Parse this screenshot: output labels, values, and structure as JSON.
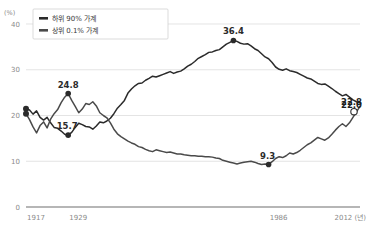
{
  "chart_data": {
    "type": "line",
    "title": "",
    "subtitle": "",
    "xlabel": "년",
    "ylabel": "(%)",
    "unit_label": "(%)",
    "xlim": [
      1917,
      2012
    ],
    "ylim": [
      0,
      40
    ],
    "grid": true,
    "y_ticks": [
      0,
      10,
      20,
      30,
      40
    ],
    "y_tick_labels": [
      "0",
      "10",
      "20",
      "30",
      "40"
    ],
    "x_ticks": [
      1917,
      1929,
      1986,
      2012
    ],
    "x_tick_labels": [
      "1917",
      "1929",
      "1986",
      "2012 (년)"
    ],
    "legend_position": "top-left",
    "series": [
      {
        "name": "하위 90% 가계",
        "color": "#2b2b2b",
        "x": [
          1917,
          1918,
          1919,
          1920,
          1921,
          1922,
          1923,
          1924,
          1925,
          1926,
          1927,
          1928,
          1929,
          1930,
          1931,
          1932,
          1933,
          1934,
          1935,
          1936,
          1937,
          1938,
          1939,
          1940,
          1941,
          1942,
          1943,
          1944,
          1945,
          1946,
          1947,
          1948,
          1949,
          1950,
          1951,
          1952,
          1953,
          1954,
          1955,
          1956,
          1957,
          1958,
          1959,
          1960,
          1961,
          1962,
          1963,
          1964,
          1965,
          1966,
          1967,
          1968,
          1969,
          1970,
          1971,
          1972,
          1973,
          1974,
          1975,
          1976,
          1977,
          1978,
          1979,
          1980,
          1981,
          1982,
          1983,
          1984,
          1985,
          1986,
          1987,
          1988,
          1989,
          1990,
          1991,
          1992,
          1993,
          1994,
          1995,
          1996,
          1997,
          1998,
          1999,
          2000,
          2001,
          2002,
          2003,
          2004,
          2005,
          2006,
          2007,
          2008,
          2009,
          2010,
          2011,
          2012
        ],
        "values": [
          21.5,
          21.2,
          20.3,
          21.0,
          19.6,
          19.0,
          19.6,
          18.4,
          17.4,
          17.2,
          16.6,
          15.9,
          15.7,
          16.3,
          17.4,
          18.3,
          18.0,
          17.6,
          17.5,
          17.0,
          17.7,
          18.6,
          18.4,
          18.8,
          19.4,
          20.4,
          21.6,
          22.4,
          23.3,
          24.9,
          25.8,
          26.5,
          27.0,
          27.1,
          27.7,
          28.1,
          28.6,
          28.4,
          28.7,
          29.0,
          29.3,
          29.6,
          29.2,
          29.5,
          29.7,
          30.2,
          30.8,
          31.2,
          31.8,
          32.5,
          32.9,
          33.3,
          33.8,
          33.9,
          34.2,
          34.4,
          35.0,
          35.6,
          36.0,
          36.4,
          36.2,
          35.8,
          35.6,
          35.7,
          35.2,
          34.6,
          34.2,
          33.5,
          32.8,
          32.4,
          31.6,
          30.6,
          30.1,
          29.9,
          30.2,
          29.8,
          29.6,
          29.4,
          29.0,
          28.6,
          28.2,
          28.0,
          27.5,
          27.0,
          26.8,
          26.9,
          26.4,
          25.9,
          25.3,
          24.8,
          24.3,
          24.6,
          24.0,
          23.4,
          23.0,
          22.8
        ]
      },
      {
        "name": "상위 0.1% 가계",
        "color": "#4a4a4a",
        "x": [
          1917,
          1918,
          1919,
          1920,
          1921,
          1922,
          1923,
          1924,
          1925,
          1926,
          1927,
          1928,
          1929,
          1930,
          1931,
          1932,
          1933,
          1934,
          1935,
          1936,
          1937,
          1938,
          1939,
          1940,
          1941,
          1942,
          1943,
          1944,
          1945,
          1946,
          1947,
          1948,
          1949,
          1950,
          1951,
          1952,
          1953,
          1954,
          1955,
          1956,
          1957,
          1958,
          1959,
          1960,
          1961,
          1962,
          1963,
          1964,
          1965,
          1966,
          1967,
          1968,
          1969,
          1970,
          1971,
          1972,
          1973,
          1974,
          1975,
          1976,
          1977,
          1978,
          1979,
          1980,
          1981,
          1982,
          1983,
          1984,
          1985,
          1986,
          1987,
          1988,
          1989,
          1990,
          1991,
          1992,
          1993,
          1994,
          1995,
          1996,
          1997,
          1998,
          1999,
          2000,
          2001,
          2002,
          2003,
          2004,
          2005,
          2006,
          2007,
          2008,
          2009,
          2010,
          2011,
          2012
        ],
        "values": [
          20.4,
          19.1,
          17.5,
          16.2,
          17.8,
          18.6,
          17.3,
          19.2,
          20.4,
          21.3,
          22.8,
          24.0,
          24.8,
          23.3,
          22.0,
          20.6,
          21.4,
          22.6,
          22.4,
          23.0,
          22.1,
          20.6,
          20.0,
          19.5,
          18.4,
          17.0,
          16.0,
          15.4,
          14.9,
          14.4,
          14.0,
          13.7,
          13.2,
          13.0,
          12.6,
          12.3,
          12.1,
          12.5,
          12.3,
          12.1,
          11.9,
          12.0,
          11.8,
          11.6,
          11.6,
          11.4,
          11.3,
          11.2,
          11.2,
          11.1,
          11.1,
          11.0,
          11.0,
          10.9,
          10.7,
          10.6,
          10.2,
          10.0,
          9.8,
          9.6,
          9.4,
          9.6,
          9.8,
          9.9,
          10.0,
          9.8,
          9.5,
          9.3,
          9.4,
          9.3,
          9.9,
          10.6,
          11.0,
          10.8,
          11.2,
          11.8,
          11.6,
          11.9,
          12.4,
          13.0,
          13.6,
          14.0,
          14.6,
          15.2,
          14.9,
          14.6,
          15.1,
          15.9,
          16.8,
          17.6,
          18.2,
          17.6,
          18.4,
          19.6,
          20.8,
          22.0
        ]
      }
    ],
    "annotations": [
      {
        "name": "label-24-8",
        "text": "24.8",
        "series": "상위 0.1% 가계",
        "x": 1929,
        "y": 24.8,
        "marker": "filled"
      },
      {
        "name": "label-15-7",
        "text": "15.7",
        "series": "하위 90% 가계",
        "x": 1929,
        "y": 15.7,
        "marker": "filled"
      },
      {
        "name": "label-36-4",
        "text": "36.4",
        "series": "하위 90% 가계",
        "x": 1976,
        "y": 36.4,
        "marker": "filled"
      },
      {
        "name": "label-9-3",
        "text": "9.3",
        "series": "상위 0.1% 가계",
        "x": 1986,
        "y": 9.3,
        "marker": "filled"
      },
      {
        "name": "label-22-8",
        "text": "22.8",
        "series": "하위 90% 가계",
        "x": 2012,
        "y": 22.8,
        "marker": "open"
      },
      {
        "name": "label-22-0",
        "text": "22.0",
        "series": "상위 0.1% 가계",
        "x": 2012,
        "y": 22.0,
        "marker": "none"
      }
    ],
    "start_markers": [
      {
        "name": "start-marker-top",
        "x": 1917,
        "y": 21.5
      },
      {
        "name": "start-marker-bottom",
        "x": 1917,
        "y": 20.4
      }
    ]
  },
  "legend": {
    "items": [
      {
        "label": "하위 90% 가계",
        "color": "#2b2b2b"
      },
      {
        "label": "상위 0.1% 가계",
        "color": "#4a4a4a"
      }
    ]
  },
  "axes": {
    "unit": "(%)",
    "y_labels": [
      "40",
      "30",
      "20",
      "10",
      "0"
    ],
    "x_labels": [
      "1917",
      "1929",
      "1986",
      "2012 (년)"
    ]
  }
}
